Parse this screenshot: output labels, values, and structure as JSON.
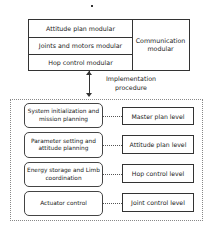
{
  "top_block": {
    "modules": [
      "Attitude plan modular",
      "Joints and motors modular",
      "Hop control modular"
    ],
    "communication": "Communication modular"
  },
  "connector": {
    "label_line1": "Implementation",
    "label_line2": "procedure",
    "arrow": "bidirectional-vertical-arrow"
  },
  "levels": [
    {
      "task": "System initialization and mission planning",
      "level": "Master plan level"
    },
    {
      "task": "Parameter setting and attitude planning",
      "level": "Attitude plan level"
    },
    {
      "task": "Energy storage and Limb coordination",
      "level": "Hop control level"
    },
    {
      "task": "Actuator control",
      "level": "Joint control level"
    }
  ]
}
